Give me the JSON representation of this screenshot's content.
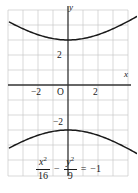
{
  "figure": {
    "title": "",
    "axis_labels": {
      "x": "x",
      "y": "y"
    },
    "origin_label": "O",
    "tick_labels": {
      "x_neg2": "−2",
      "x_pos2": "2",
      "y_pos2": "2",
      "y_neg2": "−2"
    },
    "equation": {
      "lhs_num_1": "x",
      "lhs_sup_1": "2",
      "lhs_den_1": "16",
      "operator_1": "−",
      "lhs_num_2": "y",
      "lhs_sup_2": "2",
      "lhs_den_2": "9",
      "equals": "=",
      "rhs": "−1",
      "plain": "x²/16 − y²/9 = −1"
    },
    "colors": {
      "curve": "#1a1a1a",
      "axis": "#333333",
      "grid": "#c9c9c9",
      "background": "#ffffff",
      "text": "#1a1a1a"
    }
  },
  "chart_data": {
    "type": "line",
    "title": "",
    "subtitle": "",
    "xlabel": "x",
    "ylabel": "y",
    "equation": "x^2/16 - y^2/9 = -1",
    "curve_kind": "hyperbola",
    "orientation": "vertical (opens up and down)",
    "a_semi_transverse": 3,
    "b_semi_conjugate": 4,
    "vertices": [
      [
        0,
        3
      ],
      [
        0,
        -3
      ]
    ],
    "asymptotes": [
      "y = 0.75x",
      "y = -0.75x"
    ],
    "xlim": [
      -3.9,
      4.6
    ],
    "ylim": [
      -5.0,
      5.0
    ],
    "grid": true,
    "grid_step": 1,
    "legend": "none",
    "xticks": [
      -2,
      2
    ],
    "xtick_labels": [
      "−2",
      "2"
    ],
    "yticks": [
      2,
      -2
    ],
    "ytick_labels": [
      "2",
      "−2"
    ],
    "series": [
      {
        "name": "upper branch",
        "points": [
          [
            -3.9,
            4.881
          ],
          [
            -3.6,
            4.688
          ],
          [
            -3.3,
            4.508
          ],
          [
            -3.0,
            4.342
          ],
          [
            -2.7,
            4.192
          ],
          [
            -2.4,
            4.058
          ],
          [
            -2.1,
            3.942
          ],
          [
            -1.8,
            3.843
          ],
          [
            -1.5,
            3.763
          ],
          [
            -1.2,
            3.7
          ],
          [
            -0.9,
            3.655
          ],
          [
            -0.6,
            3.627
          ],
          [
            -0.3,
            3.612
          ],
          [
            0.0,
            3.0
          ],
          [
            0.3,
            3.612
          ],
          [
            0.6,
            3.627
          ],
          [
            0.9,
            3.655
          ],
          [
            1.2,
            3.7
          ],
          [
            1.5,
            3.763
          ],
          [
            1.8,
            3.843
          ],
          [
            2.1,
            3.942
          ],
          [
            2.4,
            4.058
          ],
          [
            2.7,
            4.192
          ],
          [
            3.0,
            4.342
          ],
          [
            3.3,
            4.508
          ],
          [
            3.6,
            4.688
          ],
          [
            3.9,
            4.881
          ],
          [
            4.2,
            5.087
          ],
          [
            4.6,
            5.377
          ]
        ]
      },
      {
        "name": "lower branch",
        "points": [
          [
            -3.9,
            -4.881
          ],
          [
            -3.6,
            -4.688
          ],
          [
            -3.3,
            -4.508
          ],
          [
            -3.0,
            -4.342
          ],
          [
            -2.7,
            -4.192
          ],
          [
            -2.4,
            -4.058
          ],
          [
            -2.1,
            -3.942
          ],
          [
            -1.8,
            -3.843
          ],
          [
            -1.5,
            -3.763
          ],
          [
            -1.2,
            -3.7
          ],
          [
            -0.9,
            -3.655
          ],
          [
            -0.6,
            -3.627
          ],
          [
            -0.3,
            -3.612
          ],
          [
            0.0,
            -3.0
          ],
          [
            0.3,
            -3.612
          ],
          [
            0.6,
            -3.627
          ],
          [
            0.9,
            -3.655
          ],
          [
            1.2,
            -3.7
          ],
          [
            1.5,
            -3.763
          ],
          [
            1.8,
            -3.843
          ],
          [
            2.1,
            -3.942
          ],
          [
            2.4,
            -4.058
          ],
          [
            2.7,
            -4.192
          ],
          [
            3.0,
            -4.342
          ],
          [
            3.3,
            -4.508
          ],
          [
            3.6,
            -4.688
          ],
          [
            3.9,
            -4.881
          ],
          [
            4.2,
            -5.087
          ],
          [
            4.6,
            -5.377
          ]
        ]
      }
    ]
  }
}
